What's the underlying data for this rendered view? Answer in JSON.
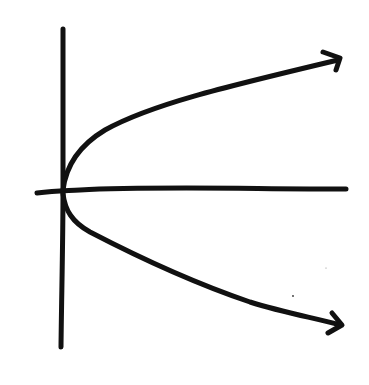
{
  "diagram": {
    "type": "hand-drawn-sketch",
    "description": "Sideways parabola opening to the right with vertex at the origin, drawn on x and y axes",
    "stroke_color": "#111111",
    "background_color": "#ffffff",
    "elements": {
      "y_axis": {
        "kind": "vertical-axis-line"
      },
      "x_axis": {
        "kind": "horizontal-axis-line"
      },
      "upper_branch": {
        "kind": "curve",
        "end": "arrowhead-right-up"
      },
      "lower_branch": {
        "kind": "curve",
        "end": "arrowhead-right-down"
      },
      "vertex": {
        "kind": "origin-point"
      }
    },
    "labels": []
  }
}
